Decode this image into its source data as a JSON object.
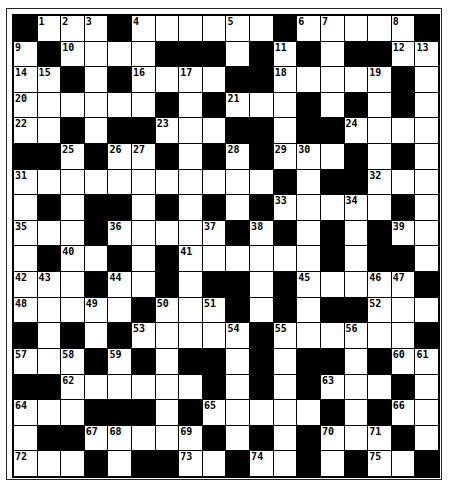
{
  "puzzle": {
    "type": "crossword",
    "rows": 18,
    "cols": 18,
    "colors": {
      "block": "#000000",
      "cell": "#ffffff",
      "border": "#000000"
    },
    "grid": [
      "#...#.....#.....#",
      "x"
    ],
    "layout": [
      [
        "#",
        "1",
        "2",
        "3",
        "#",
        "4",
        ".",
        ".",
        ".",
        "5",
        ".",
        "#",
        "6",
        "7",
        ".",
        ".",
        "8",
        "#"
      ],
      [
        "9",
        "#",
        "10",
        ".",
        ".",
        ".",
        "#",
        "#",
        "#",
        ".",
        "#",
        "11",
        "#",
        ".",
        "#",
        "#",
        "12",
        "13"
      ],
      [
        "14",
        "15",
        "#",
        ".",
        "#",
        "16",
        ".",
        "17",
        ".",
        "#",
        "#",
        "18",
        ".",
        ".",
        ".",
        "19",
        "#",
        "."
      ],
      [
        "20",
        ".",
        ".",
        ".",
        ".",
        ".",
        "#",
        ".",
        "#",
        "21",
        ".",
        ".",
        "#",
        ".",
        "#",
        ".",
        "#",
        "."
      ],
      [
        "22",
        ".",
        "#",
        ".",
        "#",
        "#",
        "23",
        ".",
        ".",
        "#",
        "#",
        ".",
        "#",
        "#",
        "24",
        ".",
        ".",
        "."
      ],
      [
        "#",
        "#",
        "25",
        "#",
        "26",
        "27",
        "#",
        ".",
        "#",
        "28",
        "#",
        "29",
        "30",
        ".",
        "#",
        ".",
        "#",
        "."
      ],
      [
        "31",
        ".",
        ".",
        ".",
        ".",
        ".",
        ".",
        ".",
        ".",
        ".",
        ".",
        "#",
        ".",
        "#",
        "#",
        "32",
        ".",
        "."
      ],
      [
        ".",
        "#",
        ".",
        "#",
        "#",
        ".",
        "#",
        ".",
        "#",
        ".",
        "#",
        "33",
        ".",
        ".",
        "34",
        ".",
        "#",
        "."
      ],
      [
        "35",
        ".",
        ".",
        "#",
        "36",
        ".",
        ".",
        ".",
        "37",
        "#",
        "38",
        "#",
        ".",
        "#",
        ".",
        "#",
        "39",
        "."
      ],
      [
        ".",
        "#",
        "40",
        ".",
        "#",
        ".",
        "#",
        "41",
        ".",
        ".",
        ".",
        ".",
        ".",
        "#",
        ".",
        "#",
        "#",
        "."
      ],
      [
        "42",
        "43",
        ".",
        "#",
        "44",
        ".",
        "#",
        ".",
        "#",
        "#",
        ".",
        "#",
        "45",
        ".",
        ".",
        "46",
        "47",
        "#"
      ],
      [
        "48",
        ".",
        ".",
        "49",
        ".",
        "#",
        "50",
        ".",
        "51",
        "#",
        ".",
        "#",
        ".",
        "#",
        "#",
        "52",
        ".",
        "."
      ],
      [
        "#",
        ".",
        "#",
        ".",
        "#",
        "53",
        ".",
        ".",
        ".",
        "54",
        "#",
        "55",
        ".",
        ".",
        "56",
        ".",
        ".",
        "#"
      ],
      [
        "57",
        ".",
        "58",
        "#",
        "59",
        "#",
        ".",
        "#",
        "#",
        ".",
        "#",
        ".",
        "#",
        "#",
        ".",
        "#",
        "60",
        "61"
      ],
      [
        "#",
        "#",
        "62",
        ".",
        ".",
        ".",
        ".",
        ".",
        "#",
        ".",
        "#",
        ".",
        "#",
        "63",
        ".",
        ".",
        "#",
        "."
      ],
      [
        "64",
        ".",
        ".",
        "#",
        "#",
        "#",
        ".",
        "#",
        "65",
        ".",
        ".",
        ".",
        ".",
        "#",
        ".",
        "#",
        "66",
        "."
      ],
      [
        ".",
        "#",
        "#",
        "67",
        "68",
        ".",
        ".",
        "69",
        "#",
        ".",
        "#",
        ".",
        "#",
        "70",
        ".",
        "71",
        "#",
        "."
      ],
      [
        "72",
        ".",
        ".",
        "#",
        ".",
        "#",
        "#",
        "73",
        ".",
        "#",
        "74",
        ".",
        "#",
        ".",
        "#",
        "75",
        ".",
        "#"
      ]
    ]
  }
}
